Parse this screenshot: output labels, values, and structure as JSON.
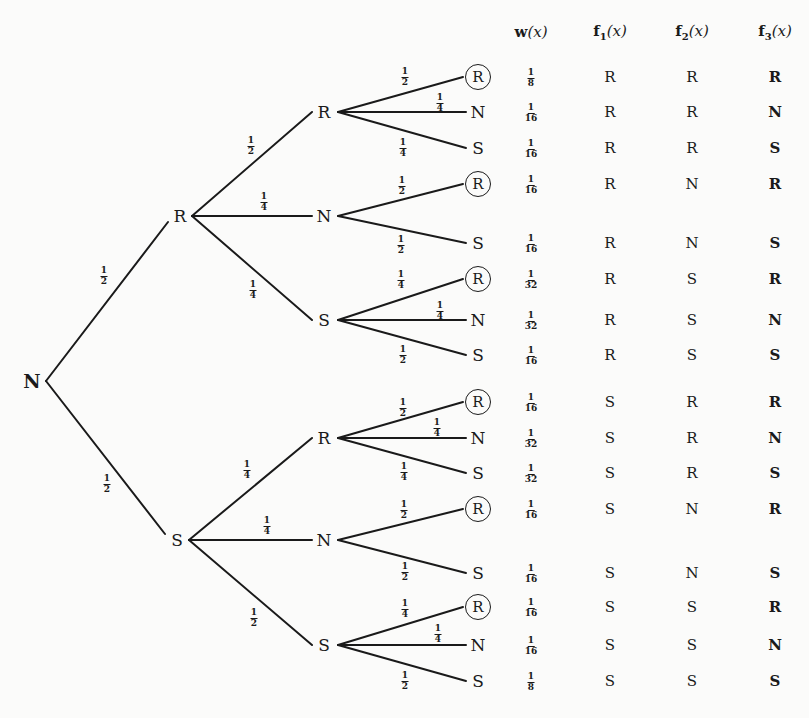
{
  "diagram": {
    "type": "probability-tree",
    "root": {
      "label": "N",
      "x": 32,
      "y": 381
    },
    "level1": [
      {
        "label": "R",
        "x": 180,
        "y": 216,
        "edge_prob": {
          "num": "1",
          "den": "2"
        },
        "prob_pos": [
          104,
          276
        ]
      },
      {
        "label": "S",
        "x": 177,
        "y": 540,
        "edge_prob": {
          "num": "1",
          "den": "2"
        },
        "prob_pos": [
          107,
          484
        ]
      }
    ],
    "level2": [
      {
        "label": "R",
        "x": 324,
        "y": 112,
        "parent": 0,
        "edge_prob": {
          "num": "1",
          "den": "2"
        },
        "prob_pos": [
          251,
          146
        ]
      },
      {
        "label": "N",
        "x": 324,
        "y": 216,
        "parent": 0,
        "edge_prob": {
          "num": "1",
          "den": "4"
        },
        "prob_pos": [
          264,
          202
        ]
      },
      {
        "label": "S",
        "x": 324,
        "y": 320,
        "parent": 0,
        "edge_prob": {
          "num": "1",
          "den": "4"
        },
        "prob_pos": [
          253,
          290
        ]
      },
      {
        "label": "R",
        "x": 324,
        "y": 438,
        "parent": 1,
        "edge_prob": {
          "num": "1",
          "den": "4"
        },
        "prob_pos": [
          247,
          470
        ]
      },
      {
        "label": "N",
        "x": 324,
        "y": 540,
        "parent": 1,
        "edge_prob": {
          "num": "1",
          "den": "4"
        },
        "prob_pos": [
          267,
          526
        ]
      },
      {
        "label": "S",
        "x": 324,
        "y": 645,
        "parent": 1,
        "edge_prob": {
          "num": "1",
          "den": "2"
        },
        "prob_pos": [
          254,
          618
        ]
      }
    ],
    "leaves": [
      {
        "label": "R",
        "circled": true,
        "parent": 0,
        "y": 77,
        "edge_prob": {
          "num": "1",
          "den": "2"
        },
        "prob_pos": [
          405,
          77
        ]
      },
      {
        "label": "N",
        "circled": false,
        "parent": 0,
        "y": 112,
        "edge_prob": {
          "num": "1",
          "den": "4"
        },
        "prob_pos": [
          440,
          103
        ]
      },
      {
        "label": "S",
        "circled": false,
        "parent": 0,
        "y": 148,
        "edge_prob": {
          "num": "1",
          "den": "4"
        },
        "prob_pos": [
          403,
          148
        ]
      },
      {
        "label": "R",
        "circled": true,
        "parent": 1,
        "y": 184,
        "edge_prob": {
          "num": "1",
          "den": "2"
        },
        "prob_pos": [
          402,
          186
        ]
      },
      {
        "label": "S",
        "circled": false,
        "parent": 1,
        "y": 243,
        "edge_prob": {
          "num": "1",
          "den": "2"
        },
        "prob_pos": [
          401,
          245
        ]
      },
      {
        "label": "R",
        "circled": true,
        "parent": 2,
        "y": 279,
        "edge_prob": {
          "num": "1",
          "den": "4"
        },
        "prob_pos": [
          401,
          280
        ]
      },
      {
        "label": "N",
        "circled": false,
        "parent": 2,
        "y": 320,
        "edge_prob": {
          "num": "1",
          "den": "4"
        },
        "prob_pos": [
          440,
          311
        ]
      },
      {
        "label": "S",
        "circled": false,
        "parent": 2,
        "y": 355,
        "edge_prob": {
          "num": "1",
          "den": "2"
        },
        "prob_pos": [
          403,
          355
        ]
      },
      {
        "label": "R",
        "circled": true,
        "parent": 3,
        "y": 402,
        "edge_prob": {
          "num": "1",
          "den": "2"
        },
        "prob_pos": [
          403,
          408
        ]
      },
      {
        "label": "N",
        "circled": false,
        "parent": 3,
        "y": 438,
        "edge_prob": {
          "num": "1",
          "den": "4"
        },
        "prob_pos": [
          437,
          428
        ]
      },
      {
        "label": "S",
        "circled": false,
        "parent": 3,
        "y": 473,
        "edge_prob": {
          "num": "1",
          "den": "4"
        },
        "prob_pos": [
          404,
          472
        ]
      },
      {
        "label": "R",
        "circled": true,
        "parent": 4,
        "y": 509,
        "edge_prob": {
          "num": "1",
          "den": "2"
        },
        "prob_pos": [
          404,
          510
        ]
      },
      {
        "label": "S",
        "circled": false,
        "parent": 4,
        "y": 573,
        "edge_prob": {
          "num": "1",
          "den": "2"
        },
        "prob_pos": [
          405,
          572
        ]
      },
      {
        "label": "R",
        "circled": true,
        "parent": 5,
        "y": 607,
        "edge_prob": {
          "num": "1",
          "den": "4"
        },
        "prob_pos": [
          405,
          609
        ]
      },
      {
        "label": "N",
        "circled": false,
        "parent": 5,
        "y": 645,
        "edge_prob": {
          "num": "1",
          "den": "4"
        },
        "prob_pos": [
          438,
          634
        ]
      },
      {
        "label": "S",
        "circled": false,
        "parent": 5,
        "y": 681,
        "edge_prob": {
          "num": "1",
          "den": "2"
        },
        "prob_pos": [
          405,
          681
        ]
      }
    ]
  },
  "table": {
    "headers": [
      {
        "bold": "w",
        "sub": "",
        "arg": "(x)"
      },
      {
        "bold": "f",
        "sub": "1",
        "arg": "(x)"
      },
      {
        "bold": "f",
        "sub": "2",
        "arg": "(x)"
      },
      {
        "bold": "f",
        "sub": "3",
        "arg": "(x)"
      }
    ],
    "rows": [
      {
        "w": {
          "num": "1",
          "den": "8"
        },
        "f1": "R",
        "f2": "R",
        "f3": "R"
      },
      {
        "w": {
          "num": "1",
          "den": "16"
        },
        "f1": "R",
        "f2": "R",
        "f3": "N"
      },
      {
        "w": {
          "num": "1",
          "den": "16"
        },
        "f1": "R",
        "f2": "R",
        "f3": "S"
      },
      {
        "w": {
          "num": "1",
          "den": "16"
        },
        "f1": "R",
        "f2": "N",
        "f3": "R"
      },
      {
        "w": {
          "num": "1",
          "den": "16"
        },
        "f1": "R",
        "f2": "N",
        "f3": "S"
      },
      {
        "w": {
          "num": "1",
          "den": "32"
        },
        "f1": "R",
        "f2": "S",
        "f3": "R"
      },
      {
        "w": {
          "num": "1",
          "den": "32"
        },
        "f1": "R",
        "f2": "S",
        "f3": "N"
      },
      {
        "w": {
          "num": "1",
          "den": "16"
        },
        "f1": "R",
        "f2": "S",
        "f3": "S"
      },
      {
        "w": {
          "num": "1",
          "den": "16"
        },
        "f1": "S",
        "f2": "R",
        "f3": "R"
      },
      {
        "w": {
          "num": "1",
          "den": "32"
        },
        "f1": "S",
        "f2": "R",
        "f3": "N"
      },
      {
        "w": {
          "num": "1",
          "den": "32"
        },
        "f1": "S",
        "f2": "R",
        "f3": "S"
      },
      {
        "w": {
          "num": "1",
          "den": "16"
        },
        "f1": "S",
        "f2": "N",
        "f3": "R"
      },
      {
        "w": {
          "num": "1",
          "den": "16"
        },
        "f1": "S",
        "f2": "N",
        "f3": "S"
      },
      {
        "w": {
          "num": "1",
          "den": "16"
        },
        "f1": "S",
        "f2": "S",
        "f3": "R"
      },
      {
        "w": {
          "num": "1",
          "den": "16"
        },
        "f1": "S",
        "f2": "S",
        "f3": "N"
      },
      {
        "w": {
          "num": "1",
          "den": "8"
        },
        "f1": "S",
        "f2": "S",
        "f3": "S"
      }
    ]
  },
  "colors": {
    "ink": "#1a1a1a",
    "paper": "#fbfbfa"
  }
}
